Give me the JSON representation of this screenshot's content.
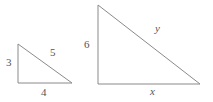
{
  "figure": {
    "background_color": "#ffffff",
    "stroke_color": "#8a8a8a",
    "label_color": "#555555",
    "width": 213,
    "height": 102
  },
  "shapes": {
    "small_triangle": {
      "name": "small-right-triangle",
      "points": "18,44 18,83 72,83",
      "vertices": {
        "top_left": [
          18,
          44
        ],
        "bottom_left": [
          18,
          83
        ],
        "bottom_right": [
          72,
          83
        ]
      },
      "labels": {
        "vertical_leg": "3",
        "hypotenuse": "5",
        "base_leg": "4"
      }
    },
    "large_triangle": {
      "name": "large-right-triangle",
      "points": "98,5 98,84 200,84",
      "vertices": {
        "top_left": [
          98,
          5
        ],
        "bottom_left": [
          98,
          84
        ],
        "bottom_right": [
          200,
          84
        ]
      },
      "labels": {
        "vertical_leg": "6",
        "hypotenuse": "y",
        "base_leg": "x"
      }
    }
  }
}
